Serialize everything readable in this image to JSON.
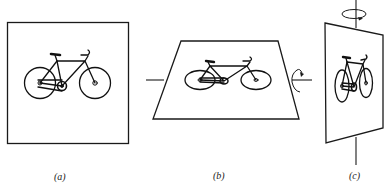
{
  "figure": {
    "stroke_color": "#1a1a1a",
    "background": "#ffffff",
    "panels": [
      {
        "id": "a",
        "label": "(a)",
        "description": "Flat square frame containing a bicycle drawing, viewed face-on"
      },
      {
        "id": "b",
        "label": "(b)",
        "description": "Frame tilted backward about a horizontal axis, appearing as a trapezoid; curved rotation arrow on the right end of the horizontal axis"
      },
      {
        "id": "c",
        "label": "(c)",
        "description": "Frame rotated about a vertical axis, appearing as a narrow quadrilateral; curved rotation arrow at the top of the vertical axis"
      }
    ]
  }
}
